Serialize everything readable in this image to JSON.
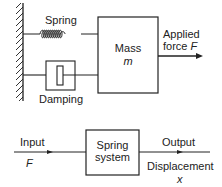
{
  "top_diagram": {
    "spring_label": "Spring",
    "damping_label": "Damping",
    "mass_label": "Mass",
    "mass_symbol": "m",
    "force_label_line1": "Applied",
    "force_label_line2": "force",
    "force_symbol": "F"
  },
  "block_diagram": {
    "input_label": "Input",
    "input_symbol": "F",
    "block_label_line1": "Spring",
    "block_label_line2": "system",
    "output_label": "Output",
    "output_desc": "Displacement",
    "output_symbol": "x"
  },
  "colors": {
    "line": "#222222",
    "background": "#ffffff"
  }
}
